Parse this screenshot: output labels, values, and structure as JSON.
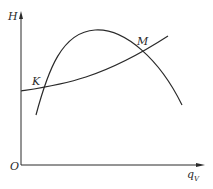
{
  "diagram": {
    "type": "pump-system-characteristic-curves",
    "axes": {
      "y_label": "H",
      "x_label_main": "q",
      "x_label_sub": "V",
      "origin_label": "O"
    },
    "curves": [
      {
        "name": "pump-curve",
        "shape": "rising then falling (parabolic hump)"
      },
      {
        "name": "system-curve",
        "shape": "monotonically increasing"
      }
    ],
    "points": [
      {
        "label": "K",
        "description": "lower intersection of pump and system curves"
      },
      {
        "label": "M",
        "description": "upper intersection of pump and system curves"
      }
    ],
    "colors": {
      "line": "#2a2a2a",
      "background": "#ffffff"
    }
  }
}
